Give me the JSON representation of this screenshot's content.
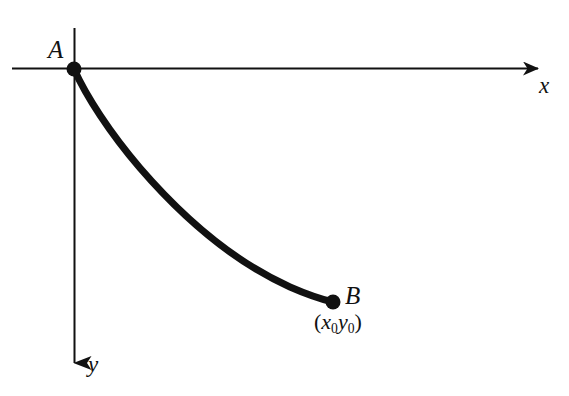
{
  "figure": {
    "background_color": "#ffffff",
    "stroke_color": "#111111",
    "width": 569,
    "height": 396,
    "axes": {
      "x_axis": {
        "label": "x",
        "direction": "right",
        "arrow": true,
        "start": [
          12,
          68
        ],
        "end": [
          553,
          68
        ],
        "line_width": 2
      },
      "y_axis": {
        "label": "y",
        "direction": "down",
        "arrow": true,
        "start": [
          74,
          28
        ],
        "end": [
          74,
          381
        ],
        "line_width": 2
      },
      "origin": [
        74,
        69
      ]
    },
    "points": [
      {
        "name": "A",
        "label": "A",
        "label_position": [
          48,
          37
        ],
        "position": [
          74,
          69
        ],
        "radius": 7.5
      },
      {
        "name": "B",
        "label": "B",
        "label_position": [
          345,
          283
        ],
        "position": [
          333,
          302
        ],
        "radius": 7.5,
        "coordinate_label": {
          "open_paren": "(",
          "x_symbol": "x",
          "x_subscript": "0",
          "y_symbol": "y",
          "y_subscript": "0",
          "close_paren": ")",
          "position": [
            314,
            311
          ]
        }
      }
    ],
    "curve": {
      "name": "cycloid-arc",
      "line_width": 7,
      "path": "M 74 69 C 86 96, 110 133, 140 168 C 178 212, 230 260, 290 287 C 306 294, 320 299, 333 302"
    }
  }
}
